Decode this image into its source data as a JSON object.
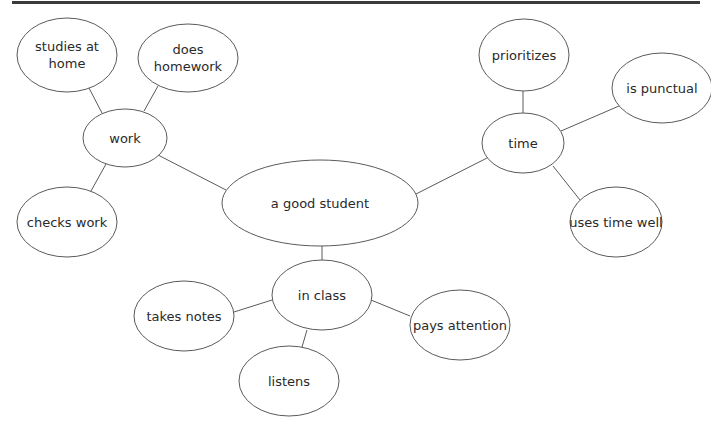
{
  "diagram": {
    "type": "mind-map",
    "central": "a good student",
    "nodes": [
      {
        "id": "center",
        "label": [
          "a good student"
        ],
        "cx": 320,
        "cy": 203,
        "rx": 98,
        "ry": 43
      },
      {
        "id": "work",
        "label": [
          "work"
        ],
        "cx": 125,
        "cy": 138,
        "rx": 42,
        "ry": 29
      },
      {
        "id": "studies-at-home",
        "label": [
          "studies at",
          "home"
        ],
        "cx": 67,
        "cy": 55,
        "rx": 50,
        "ry": 37
      },
      {
        "id": "does-homework",
        "label": [
          "does",
          "homework"
        ],
        "cx": 188,
        "cy": 58,
        "rx": 50,
        "ry": 34
      },
      {
        "id": "checks-work",
        "label": [
          "checks work"
        ],
        "cx": 67,
        "cy": 222,
        "rx": 50,
        "ry": 35
      },
      {
        "id": "time",
        "label": [
          "time"
        ],
        "cx": 523,
        "cy": 143,
        "rx": 41,
        "ry": 30
      },
      {
        "id": "prioritizes",
        "label": [
          "prioritizes"
        ],
        "cx": 524,
        "cy": 55,
        "rx": 45,
        "ry": 36
      },
      {
        "id": "is-punctual",
        "label": [
          "is punctual"
        ],
        "cx": 662,
        "cy": 88,
        "rx": 50,
        "ry": 35
      },
      {
        "id": "uses-time-well",
        "label": [
          "uses time well"
        ],
        "cx": 616,
        "cy": 222,
        "rx": 46,
        "ry": 35
      },
      {
        "id": "in-class",
        "label": [
          "in class"
        ],
        "cx": 322,
        "cy": 295,
        "rx": 50,
        "ry": 35
      },
      {
        "id": "takes-notes",
        "label": [
          "takes notes"
        ],
        "cx": 184,
        "cy": 316,
        "rx": 50,
        "ry": 35
      },
      {
        "id": "pays-attention",
        "label": [
          "pays attention"
        ],
        "cx": 460,
        "cy": 325,
        "rx": 50,
        "ry": 35
      },
      {
        "id": "listens",
        "label": [
          "listens"
        ],
        "cx": 289,
        "cy": 381,
        "rx": 50,
        "ry": 35
      }
    ],
    "edges": [
      {
        "from": "center",
        "to": "work",
        "x1": 226,
        "y1": 190,
        "x2": 158,
        "y2": 155
      },
      {
        "from": "center",
        "to": "time",
        "x1": 416,
        "y1": 194,
        "x2": 487,
        "y2": 158
      },
      {
        "from": "center",
        "to": "in-class",
        "x1": 322,
        "y1": 246,
        "x2": 322,
        "y2": 260
      },
      {
        "from": "work",
        "to": "studies-at-home",
        "x1": 102,
        "y1": 113,
        "x2": 89,
        "y2": 88
      },
      {
        "from": "work",
        "to": "does-homework",
        "x1": 144,
        "y1": 111,
        "x2": 158,
        "y2": 86
      },
      {
        "from": "work",
        "to": "checks-work",
        "x1": 106,
        "y1": 164,
        "x2": 91,
        "y2": 191
      },
      {
        "from": "time",
        "to": "prioritizes",
        "x1": 523,
        "y1": 113,
        "x2": 523,
        "y2": 91
      },
      {
        "from": "time",
        "to": "is-punctual",
        "x1": 561,
        "y1": 131,
        "x2": 619,
        "y2": 106
      },
      {
        "from": "time",
        "to": "uses-time-well",
        "x1": 553,
        "y1": 166,
        "x2": 580,
        "y2": 200
      },
      {
        "from": "in-class",
        "to": "takes-notes",
        "x1": 272,
        "y1": 300,
        "x2": 234,
        "y2": 312
      },
      {
        "from": "in-class",
        "to": "pays-attention",
        "x1": 371,
        "y1": 300,
        "x2": 410,
        "y2": 316
      },
      {
        "from": "in-class",
        "to": "listens",
        "x1": 307,
        "y1": 330,
        "x2": 302,
        "y2": 347
      }
    ]
  }
}
